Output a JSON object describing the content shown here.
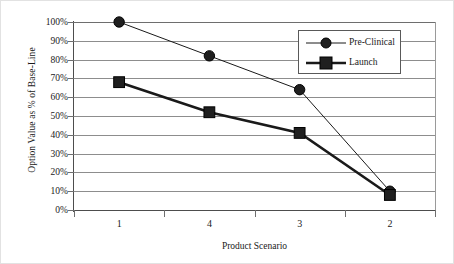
{
  "chart_data": {
    "type": "line",
    "title": "",
    "xlabel": "Product Scenario",
    "ylabel": "Option Value as % of Base-Line",
    "categories": [
      "1",
      "4",
      "3",
      "2"
    ],
    "series": [
      {
        "name": "Pre-Clinical",
        "marker": "circle",
        "color": "#1a1a1a",
        "line_width": 1,
        "values": [
          100,
          82,
          64,
          10
        ]
      },
      {
        "name": "Launch",
        "marker": "square",
        "color": "#1a1a1a",
        "line_width": 2.6,
        "values": [
          68,
          52,
          41,
          8
        ]
      }
    ],
    "ylim": [
      0,
      100
    ],
    "ytick_values": [
      100,
      90,
      80,
      70,
      60,
      50,
      40,
      30,
      20,
      10,
      0
    ],
    "ytick_labels": [
      "100%",
      "90%",
      "80%",
      "70%",
      "60%",
      "50%",
      "40%",
      "30%",
      "20%",
      "10%",
      "0%"
    ],
    "grid": "horizontal",
    "legend_position": "top-right"
  },
  "legend": {
    "entries": [
      {
        "label": "Pre-Clinical",
        "marker": "circle-marker"
      },
      {
        "label": "Launch",
        "marker": "square-marker"
      }
    ]
  },
  "axes": {
    "x_title": "Product Scenario",
    "y_title": "Option Value as % of Base-Line"
  },
  "colors": {
    "series": "#1a1a1a",
    "gridline": "#8d8d8d",
    "axis": "#4d4d4d",
    "plot_background": "#ffffff",
    "legend_border": "#595959"
  }
}
